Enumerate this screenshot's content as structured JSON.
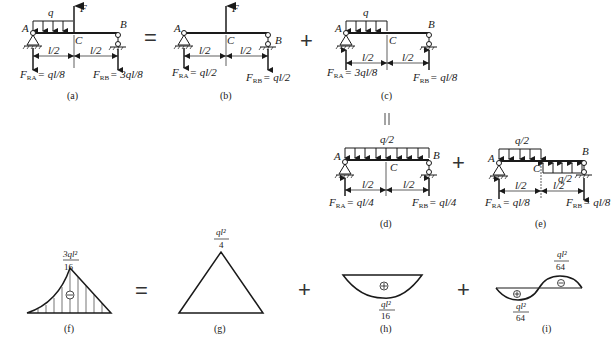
{
  "operators": {
    "equals": "=",
    "plus": "+",
    "parallel_equals": "||"
  },
  "panels": {
    "a": {
      "caption": "(a)",
      "labels": {
        "q": "q",
        "F": "F",
        "A": "A",
        "B": "B",
        "C": "C",
        "half1": "l/2",
        "half2": "l/2"
      },
      "reaction_A": {
        "symbol": "F",
        "sub": "RA",
        "value": "= ql/8"
      },
      "reaction_B": {
        "symbol": "F",
        "sub": "RB",
        "value": "= 3ql/8"
      }
    },
    "b": {
      "caption": "(b)",
      "labels": {
        "F": "F",
        "A": "A",
        "B": "B",
        "C": "C",
        "half1": "l/2",
        "half2": "l/2"
      },
      "reaction_A": {
        "symbol": "F",
        "sub": "RA",
        "value": "= ql/2"
      },
      "reaction_B": {
        "symbol": "F",
        "sub": "RB",
        "value": "= ql/2"
      }
    },
    "c": {
      "caption": "(c)",
      "labels": {
        "q": "q",
        "A": "A",
        "B": "B",
        "C": "C",
        "half1": "l/2",
        "half2": "l/2"
      },
      "reaction_A": {
        "symbol": "F",
        "sub": "RA",
        "value": "= 3ql/8"
      },
      "reaction_B": {
        "symbol": "F",
        "sub": "RB",
        "value": "= ql/8"
      }
    },
    "d": {
      "caption": "(d)",
      "labels": {
        "q": "q/2",
        "A": "A",
        "B": "B",
        "C": "C",
        "half1": "l/2",
        "half2": "l/2"
      },
      "reaction_A": {
        "symbol": "F",
        "sub": "RA",
        "value": "= ql/4"
      },
      "reaction_B": {
        "symbol": "F",
        "sub": "RB",
        "value": "= ql/4"
      }
    },
    "e": {
      "caption": "(e)",
      "labels": {
        "q_top": "q/2",
        "q_bottom": "q/2",
        "A": "A",
        "B": "B",
        "C": "C",
        "half1": "l/2",
        "half2": "l/2"
      },
      "reaction_A": {
        "symbol": "F",
        "sub": "RA",
        "value": "= ql/8"
      },
      "reaction_B": {
        "symbol": "F",
        "sub": "RB",
        "value": "= ql/8"
      }
    },
    "f": {
      "caption": "(f)",
      "peak_num": "3ql²",
      "peak_den": "16",
      "sign": "⊖"
    },
    "g": {
      "caption": "(g)",
      "peak_num": "ql²",
      "peak_den": "4"
    },
    "h": {
      "caption": "(h)",
      "peak_num": "ql²",
      "peak_den": "16",
      "sign": "⊕"
    },
    "i": {
      "caption": "(i)",
      "left_num": "ql²",
      "left_den": "64",
      "right_num": "ql²",
      "right_den": "64",
      "left_sign": "⊕",
      "right_sign": "⊖"
    }
  }
}
